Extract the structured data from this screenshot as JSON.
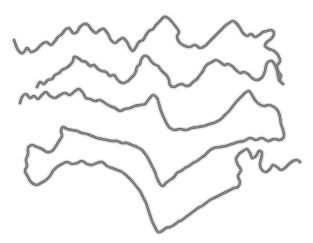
{
  "illustration": {
    "title": "Wavy chain strands illustration",
    "strand_count": 4,
    "strands": [
      {
        "name": "strand-1"
      },
      {
        "name": "strand-2"
      },
      {
        "name": "strand-3"
      },
      {
        "name": "strand-4"
      }
    ]
  },
  "colors": {
    "background": "#ffffff",
    "stroke": "#6a6a6a",
    "halo": "#9a9a9a",
    "highlight": "#b8b8b8"
  }
}
